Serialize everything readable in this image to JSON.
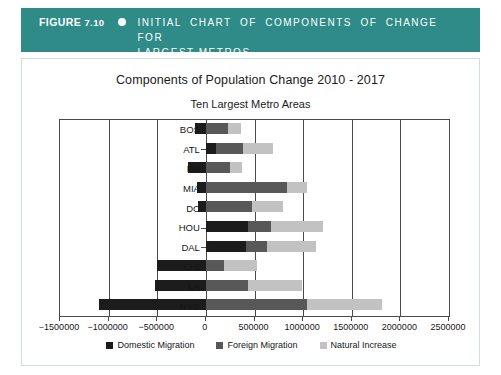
{
  "banner": {
    "figure_label": "FIGURE",
    "figure_number": "7.10",
    "bullet_icon": "dot-icon",
    "caption_line1": "INITIAL CHART OF COMPONENTS OF CHANGE FOR",
    "caption_line2": "LARGEST METROS",
    "background_color": "#2e8b87",
    "text_color": "#ffffff"
  },
  "chart_data": {
    "type": "bar",
    "orientation": "horizontal",
    "stacked": true,
    "title": "Components of Population Change 2010 - 2017",
    "subtitle": "Ten Largest Metro Areas",
    "xlabel": "",
    "ylabel": "",
    "xlim": [
      -1500000,
      2500000
    ],
    "xticks": [
      -1500000,
      -1000000,
      -500000,
      0,
      500000,
      1000000,
      1500000,
      2000000,
      2500000
    ],
    "xticklabels": [
      "−1500000",
      "−1000000",
      "−500000",
      "0",
      "500000",
      "1000000",
      "1500000",
      "2000000",
      "2500000"
    ],
    "grid": true,
    "legend_position": "bottom",
    "categories": [
      "BOS",
      "ATL",
      "PH",
      "MIA",
      "DC",
      "HOU",
      "DAL",
      "CHI",
      "LA",
      "NYC"
    ],
    "series": [
      {
        "name": "Domestic Migration",
        "color": "#1c1c1c",
        "values": [
          -110000,
          100000,
          -180000,
          -90000,
          -80000,
          430000,
          410000,
          -500000,
          -520000,
          -1100000
        ]
      },
      {
        "name": "Foreign Migration",
        "color": "#585858",
        "values": [
          230000,
          280000,
          250000,
          830000,
          470000,
          235000,
          220000,
          185000,
          430000,
          1040000
        ]
      },
      {
        "name": "Natural Increase",
        "color": "#c2c2c2",
        "values": [
          135000,
          310000,
          125000,
          210000,
          320000,
          535000,
          505000,
          340000,
          560000,
          770000
        ]
      }
    ],
    "legend": [
      "Domestic Migration",
      "Foreign Migration",
      "Natural Increase"
    ]
  }
}
